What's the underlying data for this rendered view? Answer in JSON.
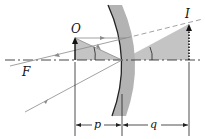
{
  "diagram": {
    "labels": {
      "object": "O",
      "image": "I",
      "focal_point": "F",
      "object_distance": "p",
      "image_distance": "q"
    },
    "colors": {
      "mirror_band": "#b3b3b3",
      "mirror_surface": "#222222",
      "shaded_triangle": "#c4c4c4",
      "ray": "#8a8a8a",
      "axis": "#333333",
      "arrow": "#111111"
    }
  }
}
